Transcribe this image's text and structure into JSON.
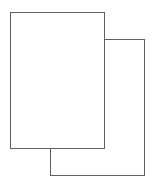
{
  "icon": {
    "name": "duplicate-pages-icon",
    "description": "Two overlapping blank pages",
    "stroke_color": "#5f5f5f",
    "fill_color": "#ffffff",
    "pages": [
      {
        "role": "front",
        "x": 10,
        "y": 12,
        "width": 95,
        "height": 137
      },
      {
        "role": "back",
        "x": 50,
        "y": 39,
        "width": 95,
        "height": 137
      }
    ]
  }
}
